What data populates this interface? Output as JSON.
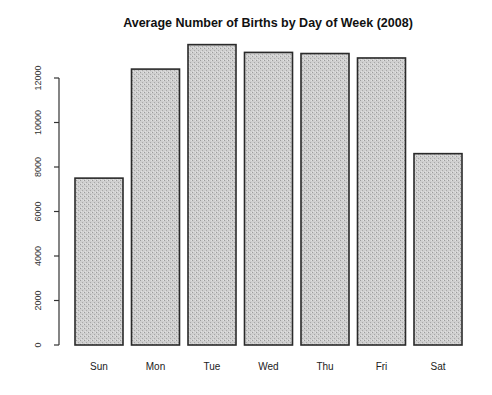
{
  "chart_data": {
    "type": "bar",
    "title": "Average Number of Births by Day of Week (2008)",
    "xlabel": "",
    "ylabel": "",
    "categories": [
      "Sun",
      "Mon",
      "Tue",
      "Wed",
      "Thu",
      "Fri",
      "Sat"
    ],
    "values": [
      7500,
      12400,
      13500,
      13150,
      13100,
      12900,
      8600
    ],
    "yticks": [
      0,
      2000,
      4000,
      6000,
      8000,
      10000,
      12000
    ],
    "ylim": [
      0,
      13500
    ],
    "grid": false,
    "legend": null,
    "bar_color": "#c8c8c8",
    "bar_edge_color": "#2a2a2a"
  }
}
